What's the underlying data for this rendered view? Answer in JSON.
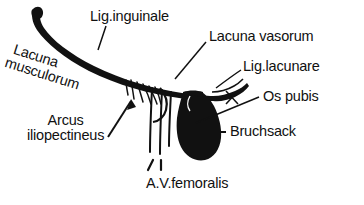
{
  "figure": {
    "kind": "anatomical-line-drawing",
    "background_color": "#ffffff",
    "ink_color": "#111111"
  },
  "labels": {
    "lig_inguinale": "Lig.inguinale",
    "lacuna_vasorum": "Lacuna vasorum",
    "lig_lacunare": "Lig.lacunare",
    "os_pubis": "Os pubis",
    "bruchsack": "Bruchsack",
    "av_femoralis": "A.V.femoralis",
    "arcus_line1": "Arcus",
    "arcus_line2": "iliopectineus",
    "lacuna_line1": "Lacuna",
    "lacuna_line2": "musculorum"
  }
}
